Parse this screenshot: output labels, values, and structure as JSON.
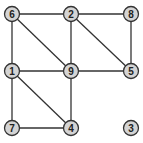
{
  "graph": {
    "nodes": [
      {
        "id": "6",
        "x": 12,
        "y": 14
      },
      {
        "id": "2",
        "x": 71,
        "y": 14
      },
      {
        "id": "8",
        "x": 131,
        "y": 14
      },
      {
        "id": "1",
        "x": 12,
        "y": 71
      },
      {
        "id": "9",
        "x": 71,
        "y": 71
      },
      {
        "id": "5",
        "x": 131,
        "y": 71
      },
      {
        "id": "7",
        "x": 12,
        "y": 128
      },
      {
        "id": "4",
        "x": 71,
        "y": 128
      },
      {
        "id": "3",
        "x": 131,
        "y": 128
      }
    ],
    "edges": [
      [
        "6",
        "2"
      ],
      [
        "2",
        "8"
      ],
      [
        "6",
        "1"
      ],
      [
        "6",
        "9"
      ],
      [
        "2",
        "9"
      ],
      [
        "2",
        "5"
      ],
      [
        "8",
        "5"
      ],
      [
        "1",
        "9"
      ],
      [
        "9",
        "5"
      ],
      [
        "1",
        "7"
      ],
      [
        "1",
        "4"
      ],
      [
        "9",
        "4"
      ],
      [
        "7",
        "4"
      ]
    ],
    "colors": {
      "node_fill": "#d4d4d4",
      "stroke": "#333333"
    }
  }
}
